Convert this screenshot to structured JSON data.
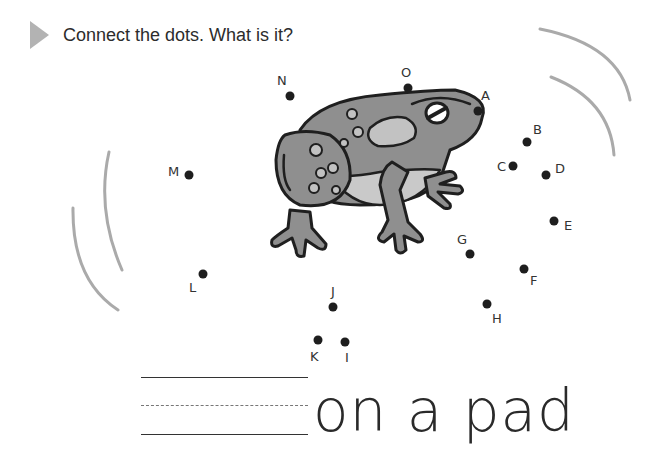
{
  "instruction": {
    "icon": "triangle-play-icon",
    "text": "Connect the dots. What is it?"
  },
  "picture": {
    "subject": "frog",
    "fill_colors": {
      "body": "#8f8f8f",
      "belly": "#c9c9c9",
      "spots": "#c2c2c2",
      "outline": "#1f1f1f"
    }
  },
  "dots": [
    {
      "label": "A",
      "x": 478,
      "y": 111
    },
    {
      "label": "B",
      "x": 527,
      "y": 142
    },
    {
      "label": "C",
      "x": 513,
      "y": 166
    },
    {
      "label": "D",
      "x": 546,
      "y": 175
    },
    {
      "label": "E",
      "x": 554,
      "y": 221
    },
    {
      "label": "F",
      "x": 524,
      "y": 269
    },
    {
      "label": "G",
      "x": 470,
      "y": 254
    },
    {
      "label": "H",
      "x": 487,
      "y": 304
    },
    {
      "label": "I",
      "x": 345,
      "y": 342
    },
    {
      "label": "J",
      "x": 333,
      "y": 307
    },
    {
      "label": "K",
      "x": 318,
      "y": 340
    },
    {
      "label": "L",
      "x": 203,
      "y": 274
    },
    {
      "label": "M",
      "x": 189,
      "y": 175
    },
    {
      "label": "N",
      "x": 290,
      "y": 96
    },
    {
      "label": "O",
      "x": 408,
      "y": 88
    }
  ],
  "answer": {
    "blank_lines": 3,
    "suffix_text": "on a pad"
  }
}
